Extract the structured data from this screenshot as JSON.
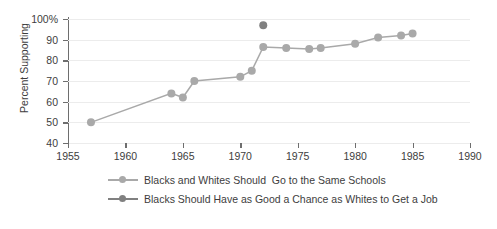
{
  "chart_data": {
    "type": "line",
    "title": "",
    "xlabel": "",
    "ylabel": "Percent Supporting",
    "xlim": [
      1955,
      1990
    ],
    "ylim": [
      40,
      100
    ],
    "xticks": [
      1955,
      1960,
      1965,
      1970,
      1975,
      1980,
      1985,
      1990
    ],
    "xtick_labels": [
      "1955",
      "1960",
      "1965",
      "1970",
      "1975",
      "1980",
      "1985",
      "1990"
    ],
    "yticks": [
      40,
      50,
      60,
      70,
      80,
      90,
      100
    ],
    "ytick_labels": [
      "40",
      "50",
      "60",
      "70",
      "80",
      "90",
      "100%"
    ],
    "grid": true,
    "legend_position": "bottom",
    "series": [
      {
        "name": "Blacks and Whites Should  Go to the Same Schools",
        "color": "#a9a9a9",
        "marker": "circle",
        "x": [
          1957,
          1964,
          1965,
          1966,
          1970,
          1971,
          1972,
          1974,
          1976,
          1977,
          1980,
          1982,
          1984,
          1985
        ],
        "values": [
          50,
          64,
          62,
          70,
          72,
          75,
          86.5,
          86,
          85.5,
          86,
          88,
          91,
          92,
          93
        ]
      },
      {
        "name": "Blacks Should Have as Good a Chance as Whites to Get a Job",
        "color": "#808080",
        "marker": "circle",
        "x": [
          1972
        ],
        "values": [
          97
        ]
      }
    ]
  },
  "axis": {
    "y_title": "Percent Supporting"
  },
  "legend": {
    "items": [
      {
        "label": "Blacks and Whites Should  Go to the Same Schools",
        "color": "#a9a9a9"
      },
      {
        "label": "Blacks Should Have as Good a Chance as Whites to Get a Job",
        "color": "#808080"
      }
    ]
  },
  "colors": {
    "axis": "#6e6e6e",
    "grid": "#ececec",
    "text": "#3d3d3d",
    "series_1": "#a9a9a9",
    "series_2": "#808080",
    "background": "#ffffff"
  }
}
